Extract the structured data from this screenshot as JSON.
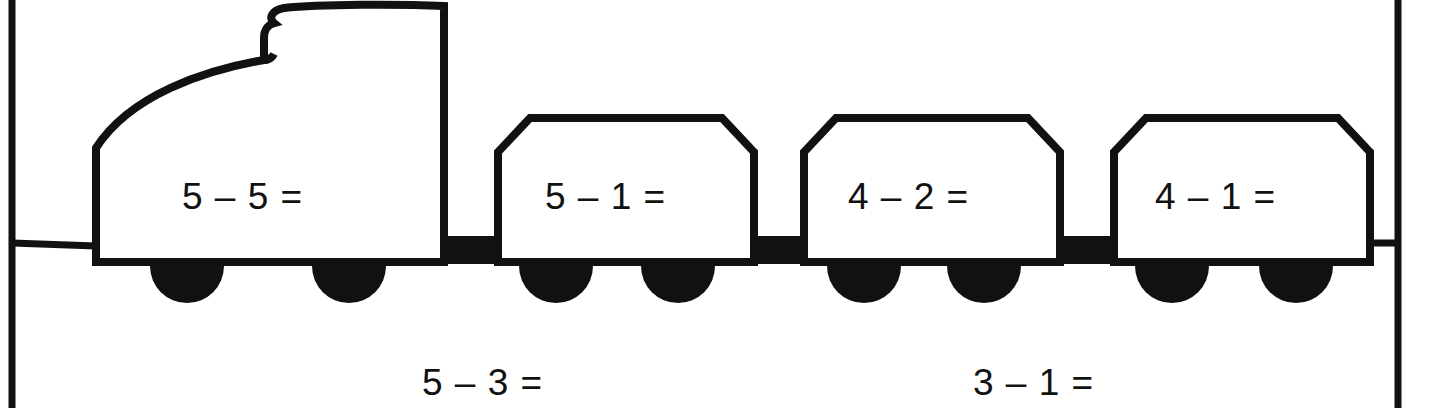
{
  "page": {
    "background_color": "#ffffff",
    "ink_color": "#111111",
    "width": 1430,
    "height": 408
  },
  "frame": {
    "left_border_x": 12,
    "right_border_x": 1398,
    "rail_y": 243
  },
  "train": {
    "locomotive": {
      "label": "5 – 5 =",
      "wheel_count": 2
    },
    "wagons": [
      {
        "label": "5 – 1 =",
        "wheel_count": 2
      },
      {
        "label": "4 – 2 =",
        "wheel_count": 2
      },
      {
        "label": "4 – 1 =",
        "wheel_count": 2
      }
    ]
  },
  "bottom_problems": [
    {
      "label": "5 – 3 ="
    },
    {
      "label": "3 – 1 ="
    }
  ]
}
